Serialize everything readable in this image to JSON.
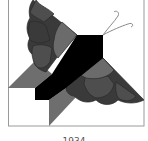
{
  "figure": {
    "caption": "1934",
    "colors": {
      "background": "#ffffff",
      "frame": "#9a9a9a",
      "body": "#000000",
      "wing_light": "#6b6b6b",
      "wing_mid": "#4e4e4e",
      "wing_dark": "#3a3a3a",
      "triangle": "#6e6e6e",
      "antenna": "#8a8a8a"
    }
  }
}
